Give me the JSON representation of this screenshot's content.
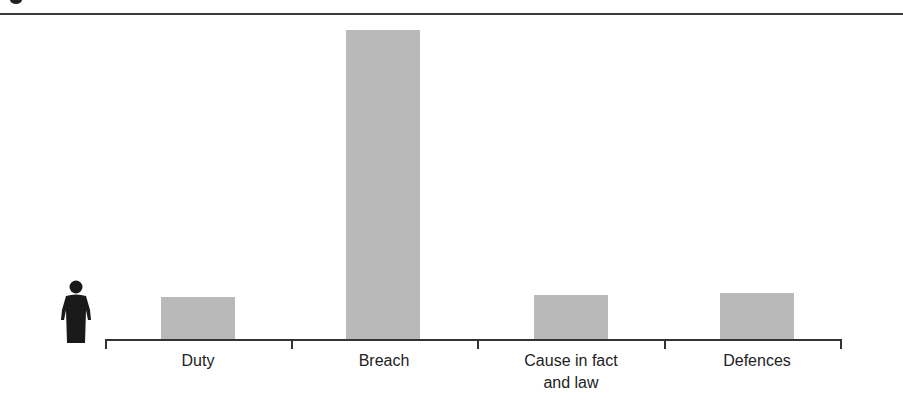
{
  "chart_data": {
    "type": "bar",
    "title": "",
    "xlabel": "",
    "ylabel": "",
    "categories": [
      "Duty",
      "Breach",
      "Cause in fact\nand law",
      "Defences"
    ],
    "values": [
      42,
      309,
      44,
      46
    ],
    "value_units": "relative bar height (px, no axis scale shown)",
    "ylim": [
      0,
      320
    ],
    "grid": false,
    "legend": null,
    "bar_color": "#b9b9b9",
    "annotations": [
      "person-icon at left of axis"
    ]
  },
  "labels": {
    "duty": "Duty",
    "breach": "Breach",
    "cause_line1": "Cause in fact",
    "cause_line2": "and law",
    "defences": "Defences"
  }
}
